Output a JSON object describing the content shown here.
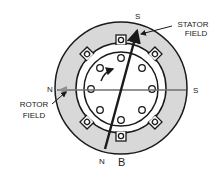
{
  "diagram": {
    "type": "motor-cross-section",
    "labels": {
      "stator_field_line1": "STATOR",
      "stator_field_line2": "FIELD",
      "rotor_field_line1": "ROTOR",
      "rotor_field_line2": "FIELD",
      "pole_top": "S",
      "pole_bottom": "N",
      "pole_left": "N",
      "pole_right": "S",
      "figure_letter": "B"
    },
    "colors": {
      "stator_fill": "#d8d8d8",
      "outline": "#1a1a1a",
      "rotor_field_line": "#707070",
      "background": "#ffffff"
    },
    "stator_slots": 8,
    "rotor_bars": 10
  }
}
